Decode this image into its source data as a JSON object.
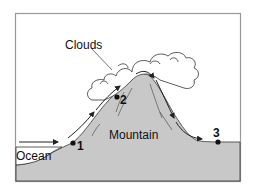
{
  "diagram": {
    "labels": {
      "clouds": "Clouds",
      "mountain": "Mountain",
      "ocean": "Ocean"
    },
    "points": [
      {
        "id": "1",
        "label": "1"
      },
      {
        "id": "2",
        "label": "2"
      },
      {
        "id": "3",
        "label": "3"
      }
    ],
    "colors": {
      "land": "#c8c8c8",
      "frame": "#999999",
      "outline": "#222222",
      "cloud_fill": "#ffffff"
    }
  }
}
